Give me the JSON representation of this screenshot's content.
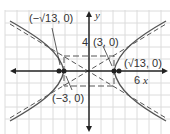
{
  "diagram": {
    "type": "hyperbola",
    "equation": "x^2/9 - y^2/4 = 1",
    "axes": {
      "x_label": "x",
      "y_label": "y",
      "x_tick_label": "6",
      "y_tick_label": "4"
    },
    "labels": {
      "left_focus": "(−√13, 0)",
      "right_focus": "(√13, 0)",
      "right_vertex": "(3, 0)",
      "left_vertex": "(−3, 0)"
    },
    "colors": {
      "grid": "#d9d9d9",
      "curve": "#555555",
      "axis": "#222222"
    }
  }
}
